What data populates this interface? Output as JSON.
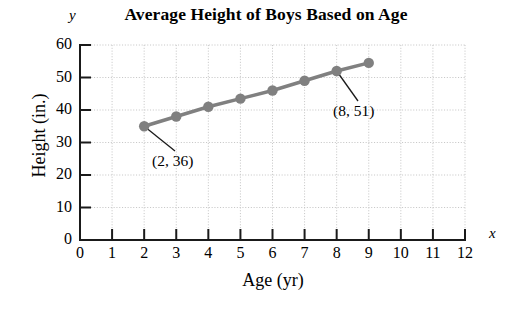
{
  "chart_data": {
    "type": "line",
    "title": "Average Height of Boys Based on Age",
    "xlabel": "Age (yr)",
    "ylabel": "Height (in.)",
    "x_axis_letter": "y",
    "y_axis_letter": "x",
    "xlim": [
      0,
      12
    ],
    "ylim": [
      0,
      60
    ],
    "grid": true,
    "legend": "none",
    "x": [
      2,
      3,
      4,
      5,
      6,
      7,
      8,
      9
    ],
    "values": [
      35,
      38,
      41,
      43.5,
      46,
      49,
      52,
      54.5
    ],
    "xticks": [
      "0",
      "1",
      "2",
      "3",
      "4",
      "5",
      "6",
      "7",
      "8",
      "9",
      "10",
      "11",
      "12"
    ],
    "yticks": [
      "0",
      "10",
      "20",
      "30",
      "40",
      "50",
      "60"
    ],
    "series_color": "#808080",
    "grid_color": "#c8c8c8",
    "axis_color": "#1a1a1a",
    "annotations": [
      {
        "label": "(2, 36)",
        "x": 2,
        "y": 36
      },
      {
        "label": "(8, 51)",
        "x": 8,
        "y": 51
      }
    ]
  },
  "axis_letters": {
    "y": "y",
    "x": "x"
  }
}
